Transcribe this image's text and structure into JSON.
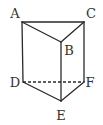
{
  "figure": {
    "stroke_color": "#2a2a2a",
    "label_color": "#333333",
    "background": "#ffffff"
  },
  "vertices": {
    "A": {
      "label": "A",
      "x": 22,
      "y": 22,
      "lx": 15,
      "ly": 18
    },
    "B": {
      "label": "B",
      "x": 61,
      "y": 42,
      "lx": 69,
      "ly": 55
    },
    "C": {
      "label": "C",
      "x": 84,
      "y": 22,
      "lx": 91,
      "ly": 18
    },
    "D": {
      "label": "D",
      "x": 23,
      "y": 82,
      "lx": 15,
      "ly": 87
    },
    "E": {
      "label": "E",
      "x": 61,
      "y": 101,
      "lx": 61,
      "ly": 120
    },
    "F": {
      "label": "F",
      "x": 84,
      "y": 82,
      "lx": 90,
      "ly": 87
    }
  },
  "edges": [
    {
      "from": "A",
      "to": "C",
      "style": "solid"
    },
    {
      "from": "A",
      "to": "B",
      "style": "solid"
    },
    {
      "from": "B",
      "to": "C",
      "style": "solid"
    },
    {
      "from": "A",
      "to": "D",
      "style": "solid"
    },
    {
      "from": "B",
      "to": "E",
      "style": "solid"
    },
    {
      "from": "C",
      "to": "F",
      "style": "solid"
    },
    {
      "from": "D",
      "to": "E",
      "style": "solid"
    },
    {
      "from": "E",
      "to": "F",
      "style": "solid"
    },
    {
      "from": "D",
      "to": "F",
      "style": "dashed"
    }
  ],
  "labels": {
    "A": "A",
    "B": "B",
    "C": "C",
    "D": "D",
    "E": "E",
    "F": "F"
  }
}
